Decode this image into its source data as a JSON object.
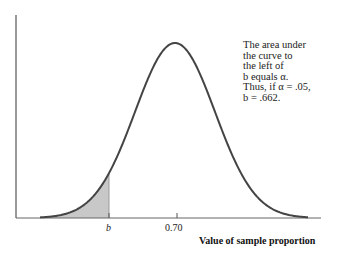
{
  "chart_data": {
    "type": "area",
    "title": "",
    "xlabel": "Value of sample proportion",
    "ylabel": "",
    "curve": "normal density",
    "mean": 0.7,
    "critical_value_label": "b",
    "critical_value": 0.662,
    "alpha": 0.05,
    "shaded_region": "left tail, area to the left of b",
    "tick_labels": [
      "b",
      "0.70"
    ],
    "grid": false,
    "annotation": [
      "The area under",
      "the curve to",
      "the left of",
      "b equals α.",
      "Thus, if α = .05,",
      "b = .662."
    ],
    "colors": {
      "curve": "#444444",
      "shade": "#c8c8c8",
      "axis": "#555555"
    }
  }
}
